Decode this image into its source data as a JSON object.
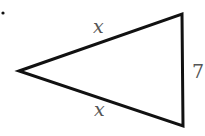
{
  "figure": {
    "type": "isosceles-triangle",
    "bullet": "•",
    "stroke_color": "#111111",
    "label_color": "#555555",
    "vertices": {
      "apex_left": [
        19,
        71
      ],
      "top_right": [
        182,
        14
      ],
      "bottom_right": [
        183,
        126
      ]
    },
    "labels": {
      "top_side": "x",
      "bottom_side": "x",
      "right_side": "7"
    }
  }
}
